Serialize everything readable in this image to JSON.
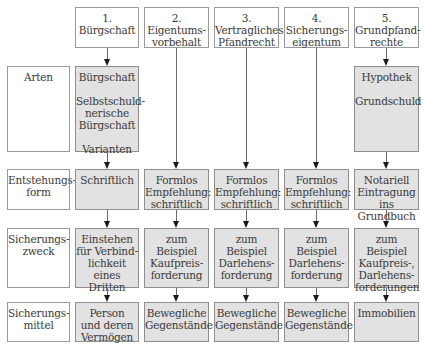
{
  "columns": [
    {
      "header": "1.\nBürgschaft"
    },
    {
      "header": "2.\nEigentums-\nvorbehalt"
    },
    {
      "header": "3.\nVertragliches\nPfandrecht"
    },
    {
      "header": "4.\nSicherungs-\neigentum"
    },
    {
      "header": "5.\nGrundpfand-\nrechte"
    }
  ],
  "rows": [
    {
      "label": "Arten",
      "cells": [
        {
          "lines": [
            "Bürgschaft",
            "",
            "Selbstschuld-",
            "nerische",
            "Bürgschaft",
            "",
            "Varianten"
          ]
        },
        null,
        null,
        null,
        {
          "lines": [
            "Hypothek",
            "",
            "Grundschuld"
          ]
        }
      ]
    },
    {
      "label": "Entstehungs-\nform",
      "cells": [
        {
          "text": "Schriftlich"
        },
        {
          "text": "Formlos\nEmpfehlung:\nschriftlich"
        },
        {
          "text": "Formlos\nEmpfehlung:\nschriftlich"
        },
        {
          "text": "Formlos\nEmpfehlung:\nschriftlich"
        },
        {
          "text": "Notariell\nEintragung ins\nGrundbuch"
        }
      ]
    },
    {
      "label": "Sicherungs-\nzweck",
      "cells": [
        {
          "text": "Einstehen\nfür Verbind-\nlichkeit eines\nDritten"
        },
        {
          "text": "zum Beispiel\nKaufpreis-\nforderung"
        },
        {
          "text": "zum Beispiel\nDarlehens-\nforderung"
        },
        {
          "text": "zum Beispiel\nDarlehens-\nforderung"
        },
        {
          "text": "zum Beispiel\nKaufpreis-,\nDarlehens-\nforderungen"
        }
      ]
    },
    {
      "label": "Sicherungs-\nmittel",
      "cells": [
        {
          "text": "Person\nund deren\nVermögen"
        },
        {
          "text": "Bewegliche\nGegenstände"
        },
        {
          "text": "Bewegliche\nGegenstände"
        },
        {
          "text": "Bewegliche\nGegenstände"
        },
        {
          "text": "Immobilien"
        }
      ]
    }
  ],
  "colors": {
    "cell_fill": "#e2e2e2",
    "border": "#9a9a9a",
    "arrow": "#1a1a1a"
  }
}
